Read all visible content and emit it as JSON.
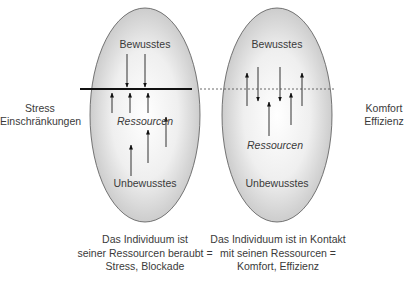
{
  "left_panel": {
    "top_label": "Bewusstes",
    "middle_label": "Ressourcen",
    "bottom_label": "Unbewusstes",
    "boundary": "solid",
    "side_label": [
      "Stress",
      "Einschränkungen"
    ],
    "caption": [
      "Das Individuum ist",
      "seiner Ressourcen beraubt =",
      "Stress, Blockade"
    ]
  },
  "right_panel": {
    "top_label": "Bewusstes",
    "middle_label": "Ressourcen",
    "bottom_label": "Unbewusstes",
    "boundary": "dashed",
    "side_label": [
      "Komfort",
      "Effizienz"
    ],
    "caption": [
      "Das Individuum ist in Kontakt",
      "mit seinen Ressourcen =",
      "Komfort, Effizienz"
    ]
  },
  "colors": {
    "ellipse_fill_center": "#ffffff",
    "ellipse_fill_edge": "#c8c8c8",
    "stroke": "#222222",
    "text": "#3a3a3a"
  }
}
